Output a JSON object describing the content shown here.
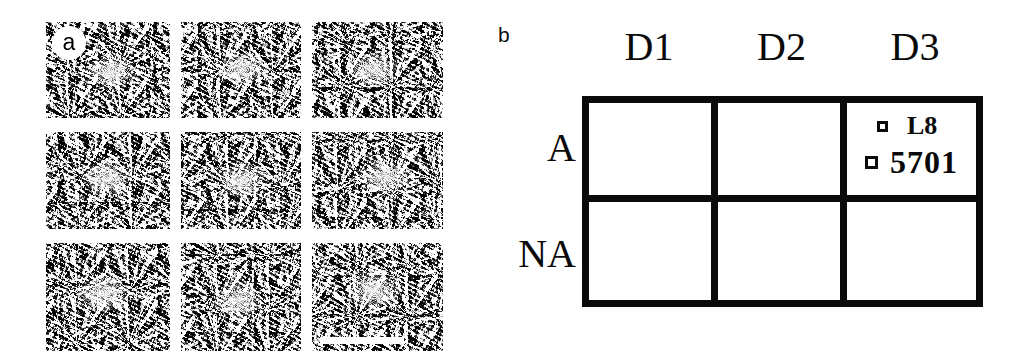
{
  "figure": {
    "background_color": "#ffffff",
    "ink_color": "#0b0b0b"
  },
  "panel_a": {
    "label": "a",
    "label_icon": "panel-letter-badge",
    "description": "3 by 3 montage of grayscale electron micrographs of single particles",
    "rows": 3,
    "columns": 3,
    "scale_bar": {
      "present": true,
      "label": "",
      "located_in_tile": 9
    },
    "tiles": [
      {
        "id": "tile-1",
        "particle_x": "52%",
        "particle_y": "52%"
      },
      {
        "id": "tile-2",
        "particle_x": "50%",
        "particle_y": "49%"
      },
      {
        "id": "tile-3",
        "particle_x": "47%",
        "particle_y": "50%"
      },
      {
        "id": "tile-4",
        "particle_x": "49%",
        "particle_y": "48%"
      },
      {
        "id": "tile-5",
        "particle_x": "51%",
        "particle_y": "51%"
      },
      {
        "id": "tile-6",
        "particle_x": "56%",
        "particle_y": "47%"
      },
      {
        "id": "tile-7",
        "particle_x": "46%",
        "particle_y": "47%"
      },
      {
        "id": "tile-8",
        "particle_x": "48%",
        "particle_y": "53%"
      },
      {
        "id": "tile-9",
        "particle_x": "47%",
        "particle_y": "44%"
      }
    ]
  },
  "panel_b": {
    "label": "b",
    "column_headers": [
      "D1",
      "D2",
      "D3"
    ],
    "row_headers": [
      "A",
      "NA"
    ],
    "cells": [
      {
        "row": "A",
        "column": "D1",
        "entries": []
      },
      {
        "row": "A",
        "column": "D2",
        "entries": []
      },
      {
        "row": "A",
        "column": "D3",
        "entries": [
          {
            "marker": "open-square-marker",
            "label": "L8"
          },
          {
            "marker": "open-square-marker",
            "label": "5701"
          }
        ]
      },
      {
        "row": "NA",
        "column": "D1",
        "entries": []
      },
      {
        "row": "NA",
        "column": "D2",
        "entries": []
      },
      {
        "row": "NA",
        "column": "D3",
        "entries": []
      }
    ]
  },
  "chart_data": {
    "type": "table",
    "title": "",
    "columns": [
      "D1",
      "D2",
      "D3"
    ],
    "rows": [
      "A",
      "NA"
    ],
    "values": [
      [
        "",
        "",
        "L8; 5701"
      ],
      [
        "",
        "",
        ""
      ]
    ],
    "legend_entries": [
      "L8",
      "5701"
    ],
    "legend_position": "inside cell A/D3",
    "grid": true
  }
}
